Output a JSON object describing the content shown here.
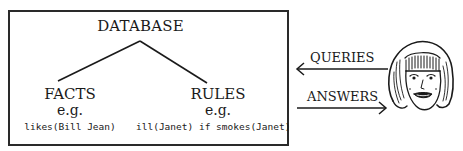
{
  "diagram": {
    "database": {
      "title": "DATABASE",
      "branches": [
        {
          "label": "FACTS",
          "eg": "e.g.",
          "example": "likes(Bill Jean)"
        },
        {
          "label": "RULES",
          "eg": "e.g.",
          "example": "ill(Janet) if smokes(Janet)"
        }
      ]
    },
    "arrows": [
      {
        "label": "QUERIES",
        "direction": "left"
      },
      {
        "label": "ANSWERS",
        "direction": "right"
      }
    ],
    "user": {
      "icon": "woman-face-icon"
    },
    "colors": {
      "line": "#1a1a1a",
      "background": "#ffffff"
    }
  }
}
